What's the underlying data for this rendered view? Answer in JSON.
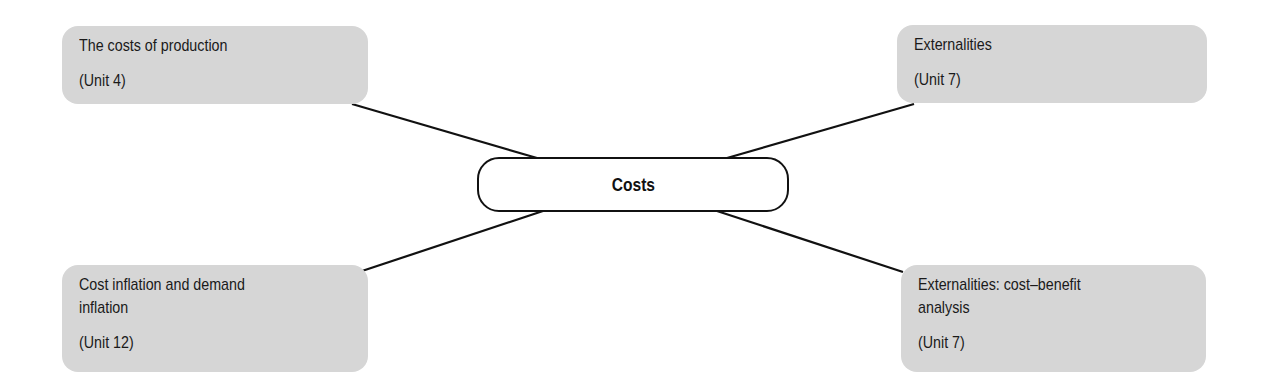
{
  "diagram": {
    "type": "mind-map",
    "center": {
      "label": "Costs"
    },
    "nodes": [
      {
        "id": "top-left",
        "title": "The costs of production",
        "unit": "(Unit 4)"
      },
      {
        "id": "top-right",
        "title": "Externalities",
        "unit": "(Unit 7)"
      },
      {
        "id": "bottom-left",
        "title": "Cost inflation and demand\ninflation",
        "unit": "(Unit 12)"
      },
      {
        "id": "bottom-right",
        "title": "Externalities: cost–benefit\nanalysis",
        "unit": "(Unit 7)"
      }
    ],
    "colors": {
      "node_fill": "#d6d6d6",
      "line": "#111111",
      "text": "#1a1a1a"
    }
  }
}
